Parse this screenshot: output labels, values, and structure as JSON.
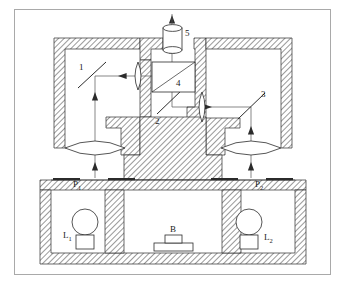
{
  "figure": {
    "type": "optical-instrument-schematic",
    "border_color": "#a9a9a9",
    "hatch_color": "#6e6e6e",
    "line_color": "#2b2b2b",
    "beam_color": "#555555"
  },
  "labels": {
    "mirror_left": "1",
    "mirror_center": "2",
    "mirror_right": "3",
    "beam_splitter_cube": "4",
    "eyepiece": "5",
    "prism_left": "P",
    "prism_left_sub": "1",
    "prism_right": "P",
    "prism_right_sub": "2",
    "lamp_left": "L",
    "lamp_left_sub": "1",
    "lamp_right": "L",
    "lamp_right_sub": "2",
    "specimen": "B"
  },
  "components": [
    {
      "id": "1",
      "name": "mirror-left",
      "kind": "mirror",
      "angle_deg": 45
    },
    {
      "id": "2",
      "name": "mirror-center",
      "kind": "mirror",
      "angle_deg": -45
    },
    {
      "id": "3",
      "name": "mirror-right",
      "kind": "mirror",
      "angle_deg": -45
    },
    {
      "id": "4",
      "name": "beam-splitter-cube",
      "kind": "beam-splitter"
    },
    {
      "id": "5",
      "name": "eyepiece",
      "kind": "eyepiece"
    },
    {
      "id": "P1",
      "name": "specimen-plane-left",
      "kind": "object-plane"
    },
    {
      "id": "P2",
      "name": "specimen-plane-right",
      "kind": "object-plane"
    },
    {
      "id": "L1",
      "name": "lamp-left",
      "kind": "light-source"
    },
    {
      "id": "L2",
      "name": "lamp-right",
      "kind": "light-source"
    },
    {
      "id": "B",
      "name": "specimen-block",
      "kind": "specimen"
    }
  ],
  "beams": [
    {
      "name": "beam-left-vertical",
      "from": "P1",
      "to": "mirror-left",
      "direction": "up"
    },
    {
      "name": "beam-left-horizontal",
      "from": "mirror-left",
      "to": "beam-splitter-cube",
      "direction": "right"
    },
    {
      "name": "beam-right-vertical",
      "from": "P2",
      "to": "mirror-right",
      "direction": "up"
    },
    {
      "name": "beam-right-horizontal",
      "from": "mirror-right",
      "to": "mirror-center",
      "direction": "left"
    },
    {
      "name": "beam-center-vertical",
      "from": "mirror-center",
      "to": "beam-splitter-cube",
      "direction": "up"
    },
    {
      "name": "beam-exit",
      "from": "beam-splitter-cube",
      "to": "eyepiece",
      "direction": "up"
    }
  ]
}
